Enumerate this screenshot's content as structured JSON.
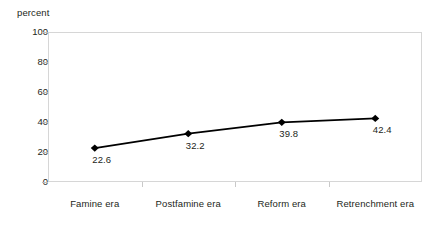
{
  "chart_data": {
    "type": "line",
    "title": "",
    "xlabel": "",
    "ylabel": "percent",
    "ylim": [
      0,
      100
    ],
    "ytick_values": [
      0,
      20,
      40,
      60,
      80,
      100
    ],
    "ytick_labels": [
      "0",
      "20",
      "40",
      "60",
      "80",
      "100"
    ],
    "grid": false,
    "legend": false,
    "categories": [
      "Famine era",
      "Postfamine era",
      "Reform era",
      "Retrenchment era"
    ],
    "values": [
      22.6,
      32.2,
      39.8,
      42.4
    ],
    "point_labels": [
      "22.6",
      "32.2",
      "39.8",
      "42.4"
    ],
    "marker": "diamond",
    "line_color": "#000000",
    "marker_color": "#000000",
    "frame_color": "#d6d6d6",
    "text_color": "#231f20",
    "background_color": "#ffffff"
  },
  "axis": {
    "y_title": "percent"
  }
}
